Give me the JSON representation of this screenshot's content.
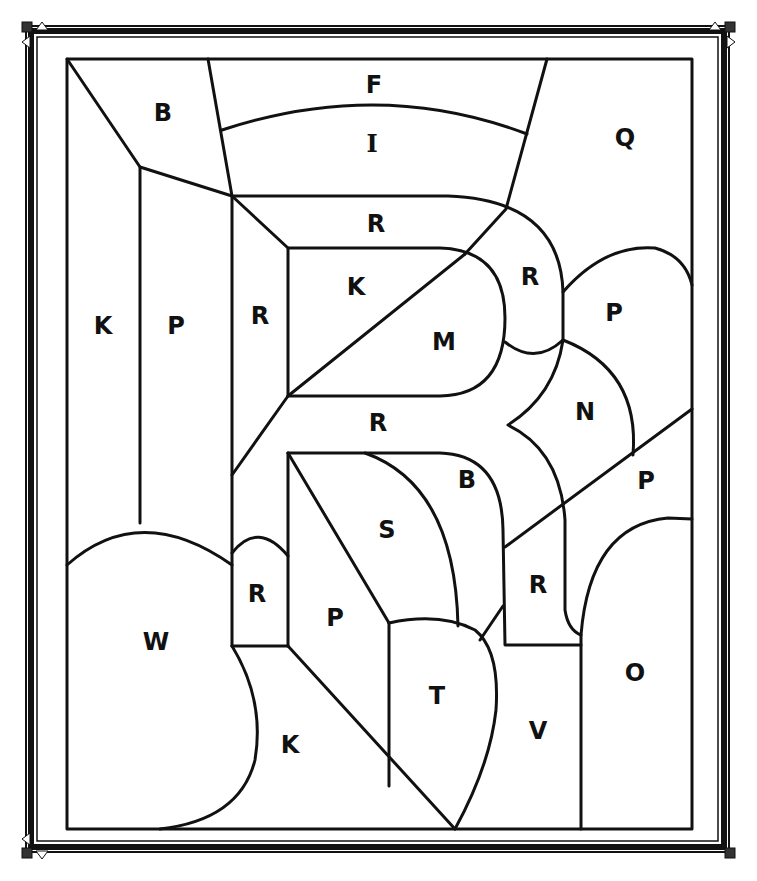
{
  "page": {
    "type": "color-by-letter coloring page",
    "line_color": "#111111",
    "background": "#ffffff"
  },
  "regions": [
    {
      "id": "b-top",
      "letter": "B",
      "x": 163,
      "y": 113
    },
    {
      "id": "f-top",
      "letter": "F",
      "x": 374,
      "y": 85
    },
    {
      "id": "i-top",
      "letter": "I",
      "x": 372,
      "y": 143
    },
    {
      "id": "q-top",
      "letter": "Q",
      "x": 625,
      "y": 138
    },
    {
      "id": "r-top-bar",
      "letter": "R",
      "x": 376,
      "y": 224
    },
    {
      "id": "k-left",
      "letter": "K",
      "x": 103,
      "y": 326
    },
    {
      "id": "p-left",
      "letter": "P",
      "x": 176,
      "y": 326
    },
    {
      "id": "r-left-stem",
      "letter": "R",
      "x": 260,
      "y": 316
    },
    {
      "id": "k-inner",
      "letter": "K",
      "x": 356,
      "y": 287
    },
    {
      "id": "m-inner",
      "letter": "M",
      "x": 444,
      "y": 342
    },
    {
      "id": "r-bowl",
      "letter": "R",
      "x": 530,
      "y": 277
    },
    {
      "id": "p-right",
      "letter": "P",
      "x": 614,
      "y": 313
    },
    {
      "id": "n-right",
      "letter": "N",
      "x": 585,
      "y": 412
    },
    {
      "id": "r-mid-bar",
      "letter": "R",
      "x": 378,
      "y": 423
    },
    {
      "id": "p-right-low",
      "letter": "P",
      "x": 646,
      "y": 481
    },
    {
      "id": "s-center",
      "letter": "S",
      "x": 387,
      "y": 530
    },
    {
      "id": "b-center",
      "letter": "B",
      "x": 467,
      "y": 480
    },
    {
      "id": "r-leg",
      "letter": "R",
      "x": 538,
      "y": 585
    },
    {
      "id": "r-small",
      "letter": "R",
      "x": 257,
      "y": 594
    },
    {
      "id": "p-center",
      "letter": "P",
      "x": 335,
      "y": 618
    },
    {
      "id": "w-bottom",
      "letter": "W",
      "x": 156,
      "y": 642
    },
    {
      "id": "o-bottom",
      "letter": "O",
      "x": 635,
      "y": 673
    },
    {
      "id": "t-bottom",
      "letter": "T",
      "x": 437,
      "y": 696
    },
    {
      "id": "v-bottom",
      "letter": "V",
      "x": 538,
      "y": 731
    },
    {
      "id": "k-bottom",
      "letter": "K",
      "x": 290,
      "y": 745
    }
  ]
}
